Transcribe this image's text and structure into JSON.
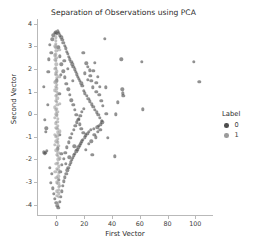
{
  "chart_data": {
    "type": "scatter",
    "title": "Separation of Observations using PCA",
    "xlabel": "First Vector",
    "ylabel": "Second Vector",
    "xlim": [
      -14,
      112
    ],
    "ylim": [
      -4.45,
      4.2
    ],
    "xticks": [
      0,
      20,
      40,
      60,
      80,
      100
    ],
    "xtick_labels": [
      "0",
      "20",
      "40",
      "60",
      "80",
      "100"
    ],
    "yticks": [
      4,
      3,
      2,
      1,
      0,
      -1,
      -2,
      -3,
      -4
    ],
    "ytick_labels": [
      "4",
      "3",
      "2",
      "1",
      "0",
      "-1",
      "-2",
      "-3",
      "-4"
    ],
    "grid": false,
    "legend": {
      "title": "Label",
      "position": "right-outside",
      "entries": [
        {
          "label": "0",
          "color": "#4d4d4d"
        },
        {
          "label": "1",
          "color": "#9b9b9b"
        }
      ]
    },
    "marker": {
      "shape": "circle",
      "size_px": 3.4,
      "alpha": 0.62
    },
    "series": [
      {
        "name": "0",
        "color": "#4d4d4d",
        "points": [
          [
            -9.2,
            1.22
          ],
          [
            -8.4,
            -0.24
          ],
          [
            -7.8,
            -0.78
          ],
          [
            -7.4,
            -0.62
          ],
          [
            -8.9,
            -1.68
          ],
          [
            -8.2,
            -1.72
          ],
          [
            -7.6,
            -1.7
          ],
          [
            -6.9,
            -1.62
          ],
          [
            -6.2,
            0.42
          ],
          [
            -5.8,
            1.86
          ],
          [
            -5.4,
            2.42
          ],
          [
            -5.0,
            -2.36
          ],
          [
            -4.6,
            3.05
          ],
          [
            -4.2,
            -3.02
          ],
          [
            -3.8,
            2.7
          ],
          [
            -3.4,
            -2.62
          ],
          [
            -3.0,
            3.3
          ],
          [
            -2.6,
            -3.28
          ],
          [
            -2.2,
            3.48
          ],
          [
            -1.8,
            -3.52
          ],
          [
            -1.4,
            3.58
          ],
          [
            -1.0,
            -3.74
          ],
          [
            -0.6,
            3.62
          ],
          [
            -0.2,
            -3.92
          ],
          [
            0.2,
            3.55
          ],
          [
            0.6,
            -4.05
          ],
          [
            1.0,
            3.66
          ],
          [
            1.4,
            -4.12
          ],
          [
            1.8,
            3.58
          ],
          [
            2.2,
            -3.86
          ],
          [
            2.6,
            3.48
          ],
          [
            3.0,
            -3.64
          ],
          [
            3.4,
            3.4
          ],
          [
            3.8,
            -3.4
          ],
          [
            4.2,
            3.28
          ],
          [
            4.6,
            -3.16
          ],
          [
            5.0,
            3.16
          ],
          [
            5.4,
            -2.96
          ],
          [
            5.8,
            3.02
          ],
          [
            6.2,
            -2.78
          ],
          [
            6.6,
            2.9
          ],
          [
            7.0,
            -2.62
          ],
          [
            7.4,
            2.76
          ],
          [
            7.8,
            -2.48
          ],
          [
            8.2,
            2.66
          ],
          [
            8.6,
            -2.36
          ],
          [
            9.0,
            2.52
          ],
          [
            9.4,
            -2.24
          ],
          [
            9.8,
            2.42
          ],
          [
            10.2,
            -2.12
          ],
          [
            10.6,
            2.3
          ],
          [
            11.0,
            -2.02
          ],
          [
            11.4,
            2.2
          ],
          [
            11.8,
            -1.92
          ],
          [
            12.2,
            2.08
          ],
          [
            12.6,
            -1.82
          ],
          [
            13.0,
            1.98
          ],
          [
            13.4,
            -1.74
          ],
          [
            13.8,
            1.86
          ],
          [
            14.2,
            -1.64
          ],
          [
            14.6,
            1.76
          ],
          [
            15.0,
            -1.56
          ],
          [
            15.4,
            1.66
          ],
          [
            15.8,
            -1.46
          ],
          [
            16.2,
            1.56
          ],
          [
            16.6,
            -1.38
          ],
          [
            17.0,
            1.46
          ],
          [
            17.4,
            -1.28
          ],
          [
            17.8,
            1.36
          ],
          [
            18.2,
            -1.2
          ],
          [
            18.6,
            1.26
          ],
          [
            19.0,
            -1.12
          ],
          [
            19.4,
            2.72
          ],
          [
            19.8,
            1.02
          ],
          [
            20.2,
            -1.02
          ],
          [
            20.6,
            0.92
          ],
          [
            21.0,
            -0.94
          ],
          [
            21.4,
            2.24
          ],
          [
            21.8,
            0.8
          ],
          [
            22.2,
            -0.86
          ],
          [
            22.6,
            2.1
          ],
          [
            23.0,
            0.68
          ],
          [
            23.4,
            -0.78
          ],
          [
            23.8,
            1.94
          ],
          [
            24.2,
            0.56
          ],
          [
            24.6,
            -0.7
          ],
          [
            25.0,
            1.46
          ],
          [
            25.4,
            0.44
          ],
          [
            25.8,
            -1.78
          ],
          [
            26.2,
            1.18
          ],
          [
            26.6,
            0.32
          ],
          [
            27.0,
            -0.64
          ],
          [
            27.4,
            2.26
          ],
          [
            27.8,
            0.2
          ],
          [
            28.2,
            -1.02
          ],
          [
            28.6,
            0.98
          ],
          [
            29.0,
            0.08
          ],
          [
            29.4,
            -0.58
          ],
          [
            29.8,
            1.64
          ],
          [
            30.2,
            -0.04
          ],
          [
            30.6,
            -0.5
          ],
          [
            31.0,
            1.2
          ],
          [
            31.4,
            -0.16
          ],
          [
            31.8,
            -0.44
          ],
          [
            32.2,
            0.58
          ],
          [
            32.6,
            -0.28
          ],
          [
            33.0,
            -0.36
          ],
          [
            33.4,
            0.36
          ],
          [
            34.6,
            3.32
          ],
          [
            35.4,
            1.18
          ],
          [
            36.0,
            0.02
          ],
          [
            36.8,
            -1.04
          ],
          [
            42.2,
            -1.86
          ],
          [
            42.8,
            0.0
          ],
          [
            44.0,
            0.52
          ],
          [
            46.8,
            2.42
          ],
          [
            47.4,
            1.1
          ],
          [
            47.8,
            0.92
          ],
          [
            48.2,
            0.8
          ],
          [
            61.6,
            2.3
          ],
          [
            62.2,
            0.22
          ],
          [
            99.0,
            2.32
          ],
          [
            102.8,
            1.42
          ],
          [
            1.2,
            2.95
          ],
          [
            2.4,
            2.55
          ],
          [
            3.6,
            2.2
          ],
          [
            4.8,
            1.9
          ],
          [
            6.0,
            1.62
          ],
          [
            7.2,
            1.34
          ],
          [
            8.4,
            1.1
          ],
          [
            9.6,
            0.86
          ],
          [
            10.8,
            0.62
          ],
          [
            12.0,
            0.4
          ],
          [
            13.2,
            0.18
          ],
          [
            14.4,
            -0.04
          ],
          [
            15.6,
            -0.24
          ],
          [
            16.8,
            -0.44
          ],
          [
            18.0,
            -0.64
          ],
          [
            19.2,
            -0.82
          ],
          [
            1.6,
            -2.9
          ],
          [
            2.8,
            -2.55
          ],
          [
            4.0,
            -2.24
          ],
          [
            5.2,
            -1.96
          ],
          [
            6.4,
            -1.7
          ],
          [
            7.6,
            -1.46
          ],
          [
            8.8,
            -1.24
          ],
          [
            10.0,
            -1.04
          ],
          [
            11.2,
            -0.86
          ],
          [
            12.4,
            -0.68
          ],
          [
            13.6,
            -0.52
          ],
          [
            14.8,
            -0.36
          ],
          [
            16.0,
            -0.2
          ],
          [
            17.2,
            -0.06
          ],
          [
            18.4,
            0.1
          ],
          [
            19.6,
            0.24
          ],
          [
            0.4,
            1.5
          ],
          [
            0.8,
            -1.5
          ],
          [
            2.0,
            0.9
          ],
          [
            2.4,
            -0.9
          ],
          [
            3.2,
            1.75
          ],
          [
            3.6,
            -1.75
          ],
          [
            5.6,
            2.35
          ],
          [
            6.8,
            -2.2
          ],
          [
            8.0,
            2.0
          ],
          [
            9.2,
            -1.9
          ],
          [
            11.6,
            1.48
          ],
          [
            12.8,
            -1.42
          ],
          [
            20.4,
            1.8
          ],
          [
            21.2,
            -1.58
          ],
          [
            22.4,
            1.52
          ],
          [
            23.2,
            -1.3
          ],
          [
            24.4,
            1.7
          ],
          [
            25.2,
            -1.2
          ],
          [
            26.4,
            1.92
          ],
          [
            27.2,
            -0.9
          ],
          [
            28.8,
            1.38
          ],
          [
            29.6,
            -0.78
          ],
          [
            30.8,
            0.86
          ],
          [
            31.6,
            -0.7
          ]
        ]
      },
      {
        "name": "1",
        "color": "#9b9b9b",
        "points": [
          [
            -0.4,
            3.4
          ],
          [
            -0.3,
            3.1
          ],
          [
            -0.2,
            2.8
          ],
          [
            -0.1,
            2.5
          ],
          [
            0.0,
            2.2
          ],
          [
            0.1,
            1.9
          ],
          [
            0.2,
            1.6
          ],
          [
            0.3,
            1.3
          ],
          [
            0.4,
            1.0
          ],
          [
            0.5,
            0.7
          ],
          [
            0.6,
            0.4
          ],
          [
            0.7,
            0.1
          ],
          [
            0.8,
            -0.2
          ],
          [
            0.9,
            -0.5
          ],
          [
            1.0,
            -0.8
          ],
          [
            1.1,
            -1.1
          ],
          [
            1.2,
            -1.4
          ],
          [
            1.3,
            -1.7
          ],
          [
            1.4,
            -2.0
          ],
          [
            1.5,
            -2.3
          ],
          [
            1.6,
            -2.6
          ],
          [
            1.7,
            -2.9
          ],
          [
            1.8,
            -3.2
          ],
          [
            1.9,
            -3.5
          ],
          [
            -0.6,
            3.25
          ],
          [
            -0.5,
            2.95
          ],
          [
            -0.45,
            2.65
          ],
          [
            -0.35,
            2.35
          ],
          [
            -0.25,
            2.05
          ],
          [
            -0.15,
            1.75
          ],
          [
            -0.05,
            1.45
          ],
          [
            0.05,
            1.15
          ],
          [
            0.15,
            0.85
          ],
          [
            0.25,
            0.55
          ],
          [
            0.35,
            0.25
          ],
          [
            0.45,
            -0.05
          ],
          [
            0.55,
            -0.35
          ],
          [
            0.65,
            -0.65
          ],
          [
            0.75,
            -0.95
          ],
          [
            0.85,
            -1.25
          ],
          [
            0.95,
            -1.55
          ],
          [
            1.05,
            -1.85
          ],
          [
            1.15,
            -2.15
          ],
          [
            1.25,
            -2.45
          ],
          [
            1.35,
            -2.75
          ],
          [
            1.45,
            -3.05
          ],
          [
            1.55,
            -3.35
          ],
          [
            1.65,
            -3.65
          ],
          [
            -0.8,
            3.0
          ],
          [
            -0.7,
            2.4
          ],
          [
            -0.55,
            1.8
          ],
          [
            -0.4,
            1.2
          ],
          [
            -0.3,
            0.6
          ],
          [
            -0.2,
            0.0
          ],
          [
            -0.1,
            -0.6
          ],
          [
            0.0,
            -1.2
          ],
          [
            0.1,
            -1.8
          ],
          [
            0.2,
            -2.4
          ],
          [
            0.3,
            -3.0
          ],
          [
            0.45,
            -3.6
          ],
          [
            -1.0,
            2.6
          ],
          [
            -0.9,
            2.0
          ],
          [
            -0.75,
            1.4
          ],
          [
            -0.6,
            0.8
          ],
          [
            -0.5,
            0.2
          ],
          [
            -0.4,
            -0.4
          ],
          [
            -0.3,
            -1.0
          ],
          [
            -0.2,
            -1.6
          ],
          [
            -0.1,
            -2.2
          ],
          [
            0.0,
            -2.8
          ],
          [
            0.15,
            -3.4
          ],
          [
            0.6,
            -3.95
          ],
          [
            -1.2,
            1.05
          ],
          [
            -1.1,
            -0.15
          ],
          [
            -1.05,
            -1.35
          ],
          [
            -0.95,
            -2.55
          ],
          [
            2.0,
            2.85
          ],
          [
            2.1,
            1.65
          ],
          [
            2.2,
            0.45
          ],
          [
            2.3,
            -0.75
          ],
          [
            2.4,
            -1.95
          ],
          [
            2.5,
            -3.15
          ],
          [
            -1.4,
            0.3
          ],
          [
            -1.3,
            -0.9
          ]
        ]
      }
    ]
  }
}
